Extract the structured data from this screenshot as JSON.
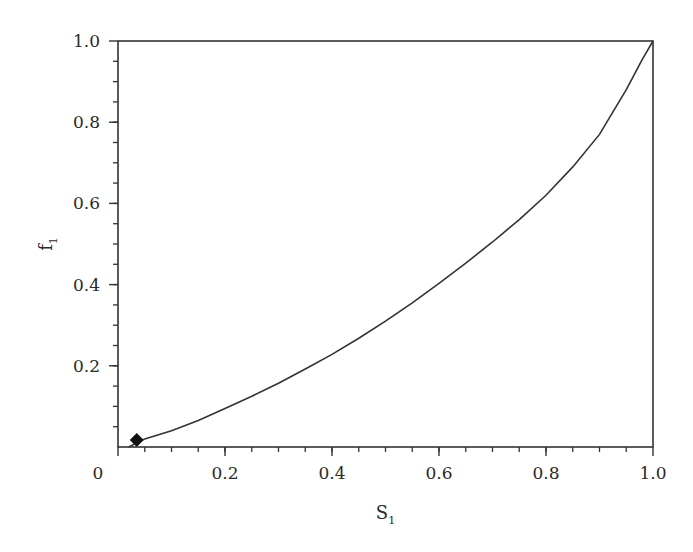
{
  "chart_data": {
    "type": "line",
    "title": "",
    "xlabel": "S",
    "xlabel_subscript": "1",
    "ylabel": "f",
    "ylabel_subscript": "1",
    "xlim": [
      0,
      1.0
    ],
    "ylim": [
      0,
      1.0
    ],
    "grid": false,
    "legend": null,
    "x_ticks": [
      {
        "value": 0,
        "label": "0"
      },
      {
        "value": 0.2,
        "label": "0.2"
      },
      {
        "value": 0.4,
        "label": "0.4"
      },
      {
        "value": 0.6,
        "label": "0.6"
      },
      {
        "value": 0.8,
        "label": "0.8"
      },
      {
        "value": 1.0,
        "label": "1.0"
      }
    ],
    "y_ticks": [
      {
        "value": 0.2,
        "label": "0.2"
      },
      {
        "value": 0.4,
        "label": "0.4"
      },
      {
        "value": 0.6,
        "label": "0.6"
      },
      {
        "value": 0.8,
        "label": "0.8"
      },
      {
        "value": 1.0,
        "label": "1.0"
      }
    ],
    "x_minor_step": 0.05,
    "y_minor_step": 0.05,
    "series": [
      {
        "name": "f1(S1)",
        "style": "solid",
        "color": "#333333",
        "x": [
          0.02,
          0.05,
          0.1,
          0.15,
          0.2,
          0.25,
          0.3,
          0.35,
          0.4,
          0.45,
          0.5,
          0.55,
          0.6,
          0.65,
          0.7,
          0.75,
          0.8,
          0.85,
          0.9,
          0.95,
          0.98,
          1.0
        ],
        "y": [
          0.0,
          0.02,
          0.04,
          0.065,
          0.095,
          0.125,
          0.157,
          0.192,
          0.228,
          0.268,
          0.31,
          0.355,
          0.403,
          0.453,
          0.505,
          0.56,
          0.62,
          0.69,
          0.77,
          0.88,
          0.955,
          1.0
        ]
      }
    ],
    "markers": [
      {
        "name": "initial-point",
        "shape": "diamond",
        "x": 0.035,
        "y": 0.017,
        "color": "#111111"
      }
    ]
  }
}
